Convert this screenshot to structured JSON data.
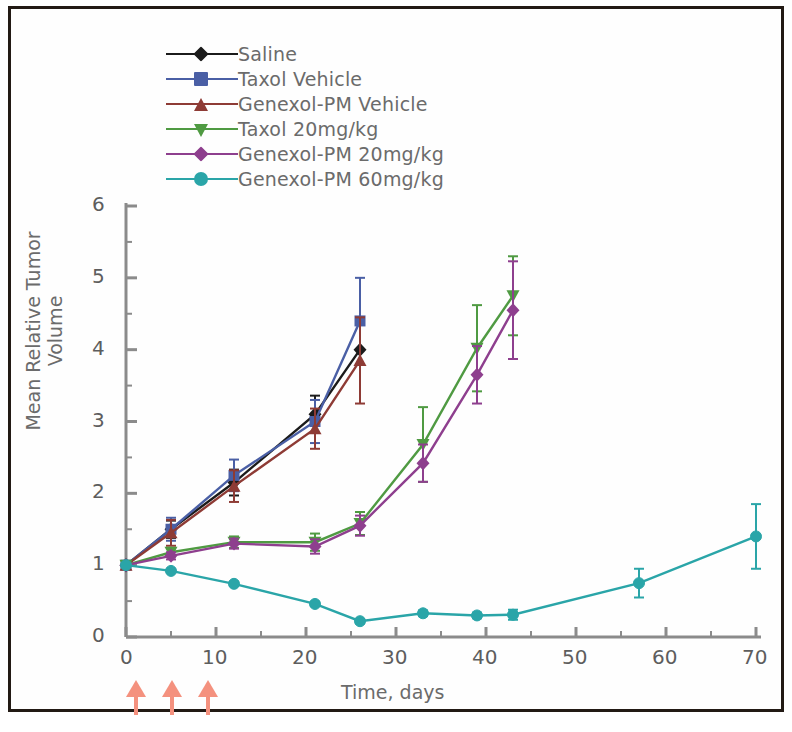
{
  "figure": {
    "border_color": "#221a14",
    "background": "#ffffff"
  },
  "legend": {
    "items": [
      {
        "label": "Saline",
        "color": "#1b1b1b",
        "marker": "diamond"
      },
      {
        "label": "Taxol Vehicle",
        "color": "#4a5fa5",
        "marker": "square"
      },
      {
        "label": "Genexol-PM Vehicle",
        "color": "#8e3b35",
        "marker": "triangle-up"
      },
      {
        "label": "Taxol 20mg/kg",
        "color": "#4f9a42",
        "marker": "triangle-down"
      },
      {
        "label": "Genexol-PM 20mg/kg",
        "color": "#8e3f8e",
        "marker": "diamond"
      },
      {
        "label": "Genexol-PM 60mg/kg",
        "color": "#2aa5a8",
        "marker": "circle"
      }
    ]
  },
  "dosing_arrows": {
    "color": "#f4917e",
    "days": [
      0,
      4,
      8
    ]
  },
  "chart_data": {
    "type": "line",
    "title": "",
    "xlabel": "Time, days",
    "ylabel": "Mean Relative Tumor Volume",
    "xlim": [
      0,
      70
    ],
    "ylim": [
      0,
      6
    ],
    "x_ticks": [
      0,
      10,
      20,
      30,
      40,
      50,
      60,
      70
    ],
    "x_minor_step": 5,
    "y_ticks": [
      0,
      1,
      2,
      3,
      4,
      5,
      6
    ],
    "y_minor_step": 0.5,
    "grid": false,
    "legend_position": "top-left",
    "error_bars": "standard error",
    "series": [
      {
        "name": "Saline",
        "color": "#1b1b1b",
        "marker": "diamond",
        "x": [
          0,
          5,
          12,
          21,
          26
        ],
        "y": [
          1.0,
          1.5,
          2.15,
          3.1,
          4.0
        ],
        "yerr": [
          0.02,
          0.12,
          0.18,
          0.26,
          0.0
        ]
      },
      {
        "name": "Taxol Vehicle",
        "color": "#4a5fa5",
        "marker": "square",
        "x": [
          0,
          5,
          12,
          21,
          26
        ],
        "y": [
          1.0,
          1.5,
          2.25,
          3.0,
          4.4
        ],
        "yerr": [
          0.02,
          0.16,
          0.22,
          0.3,
          0.6
        ]
      },
      {
        "name": "Genexol-PM Vehicle",
        "color": "#8e3b35",
        "marker": "triangle-up",
        "x": [
          0,
          5,
          12,
          21,
          26
        ],
        "y": [
          1.0,
          1.45,
          2.1,
          2.9,
          3.85
        ],
        "yerr": [
          0.02,
          0.18,
          0.22,
          0.28,
          0.6
        ]
      },
      {
        "name": "Taxol 20mg/kg",
        "color": "#4f9a42",
        "marker": "triangle-down",
        "x": [
          0,
          5,
          12,
          21,
          26,
          33,
          39,
          43
        ],
        "y": [
          1.0,
          1.18,
          1.32,
          1.32,
          1.58,
          2.68,
          4.02,
          4.75
        ],
        "yerr": [
          0.02,
          0.06,
          0.08,
          0.12,
          0.16,
          0.52,
          0.6,
          0.55
        ]
      },
      {
        "name": "Genexol-PM 20mg/kg",
        "color": "#8e3f8e",
        "marker": "diamond",
        "x": [
          0,
          5,
          12,
          21,
          26,
          33,
          39,
          43
        ],
        "y": [
          1.0,
          1.13,
          1.3,
          1.26,
          1.55,
          2.42,
          3.65,
          4.55
        ],
        "yerr": [
          0.02,
          0.05,
          0.07,
          0.1,
          0.14,
          0.26,
          0.4,
          0.68
        ]
      },
      {
        "name": "Genexol-PM 60mg/kg",
        "color": "#2aa5a8",
        "marker": "circle",
        "x": [
          0,
          5,
          12,
          21,
          26,
          33,
          39,
          43,
          57,
          70
        ],
        "y": [
          1.0,
          0.92,
          0.74,
          0.46,
          0.22,
          0.33,
          0.3,
          0.31,
          0.75,
          1.4
        ],
        "yerr": [
          0.02,
          0.02,
          0.03,
          0.03,
          0.03,
          0.04,
          0.04,
          0.07,
          0.2,
          0.45
        ]
      }
    ]
  }
}
